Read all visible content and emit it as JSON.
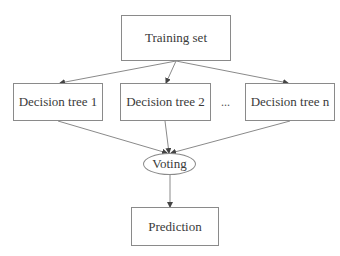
{
  "diagram": {
    "type": "flowchart",
    "nodes": {
      "training": {
        "label": "Training set"
      },
      "tree1": {
        "label": "Decision tree 1"
      },
      "tree2": {
        "label": "Decision tree 2"
      },
      "ellipsis": {
        "label": "..."
      },
      "treen": {
        "label": "Decision tree n"
      },
      "voting": {
        "label": "Voting"
      },
      "prediction": {
        "label": "Prediction"
      }
    },
    "edges": [
      {
        "from": "training",
        "to": "tree1"
      },
      {
        "from": "training",
        "to": "tree2"
      },
      {
        "from": "training",
        "to": "treen"
      },
      {
        "from": "tree1",
        "to": "voting"
      },
      {
        "from": "tree2",
        "to": "voting"
      },
      {
        "from": "treen",
        "to": "voting"
      },
      {
        "from": "voting",
        "to": "prediction"
      }
    ],
    "colors": {
      "line": "#8a8a8a",
      "text": "#3a3a3a",
      "background": "#ffffff"
    }
  }
}
